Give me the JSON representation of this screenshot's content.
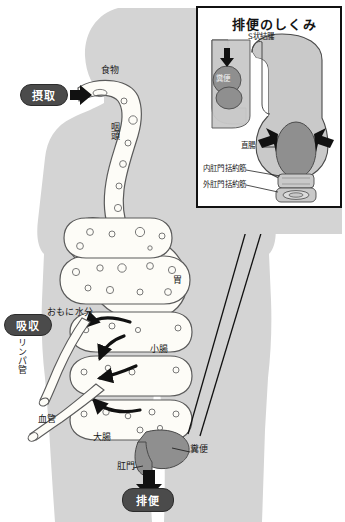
{
  "figure": {
    "title_inset": "排便のしくみ",
    "language": "ja"
  },
  "colors": {
    "body_silhouette": "#d4d4d4",
    "tract_fill": "#fdfcf7",
    "tract_stroke": "#5a5a5a",
    "feces_fill": "#8f8f8f",
    "feces_stroke": "#4a4a4a",
    "inset_organ_fill": "#c9c9c9",
    "inset_organ_stroke": "#4a4a4a",
    "badge_fill": "#4b4b4b",
    "badge_text": "#ffffff",
    "arrow": "#111111",
    "frame": "#111111",
    "page_bg": "#ffffff"
  },
  "badges": [
    {
      "name": "intake",
      "label": "摂取",
      "x": 20,
      "y": 84,
      "w": 48,
      "h": 22
    },
    {
      "name": "absorption",
      "label": "吸収",
      "x": 4,
      "y": 314,
      "w": 48,
      "h": 22
    },
    {
      "name": "defecation",
      "label": "排便",
      "x": 122,
      "y": 488,
      "w": 52,
      "h": 24
    }
  ],
  "main_labels": [
    {
      "name": "food",
      "label": "食物",
      "x": 101,
      "y": 70
    },
    {
      "name": "pharynx",
      "label": "咽頭",
      "x": 112,
      "y": 128
    },
    {
      "name": "stomach",
      "label": "胃",
      "x": 174,
      "y": 277
    },
    {
      "name": "mainly-water",
      "label": "おもに水分",
      "x": 49,
      "y": 312
    },
    {
      "name": "lymph-vessel",
      "label": "リンパ管",
      "x": 18,
      "y": 330
    },
    {
      "name": "small-intestine",
      "label": "小腸",
      "x": 152,
      "y": 348
    },
    {
      "name": "blood-vessel",
      "label": "血管",
      "x": 39,
      "y": 417
    },
    {
      "name": "large-intestine",
      "label": "大腸",
      "x": 95,
      "y": 436
    },
    {
      "name": "feces",
      "label": "糞便",
      "x": 191,
      "y": 448
    },
    {
      "name": "anus",
      "label": "肛門",
      "x": 119,
      "y": 464
    }
  ],
  "inset_labels": [
    {
      "name": "sigmoid-colon",
      "label": "S状結腸",
      "x": 248,
      "y": 33
    },
    {
      "name": "feces-inset",
      "label": "糞便",
      "x": 221,
      "y": 86
    },
    {
      "name": "rectum",
      "label": "直腸",
      "x": 243,
      "y": 144
    },
    {
      "name": "internal-anal-sphincter",
      "label": "内肛門括約筋",
      "x": 205,
      "y": 167
    },
    {
      "name": "外肛門括約筋-key",
      "label": "外肛門括約筋",
      "x": 205,
      "y": 182
    }
  ],
  "inset_frame": {
    "x": 196,
    "y": 6,
    "w": 146,
    "h": 202
  }
}
